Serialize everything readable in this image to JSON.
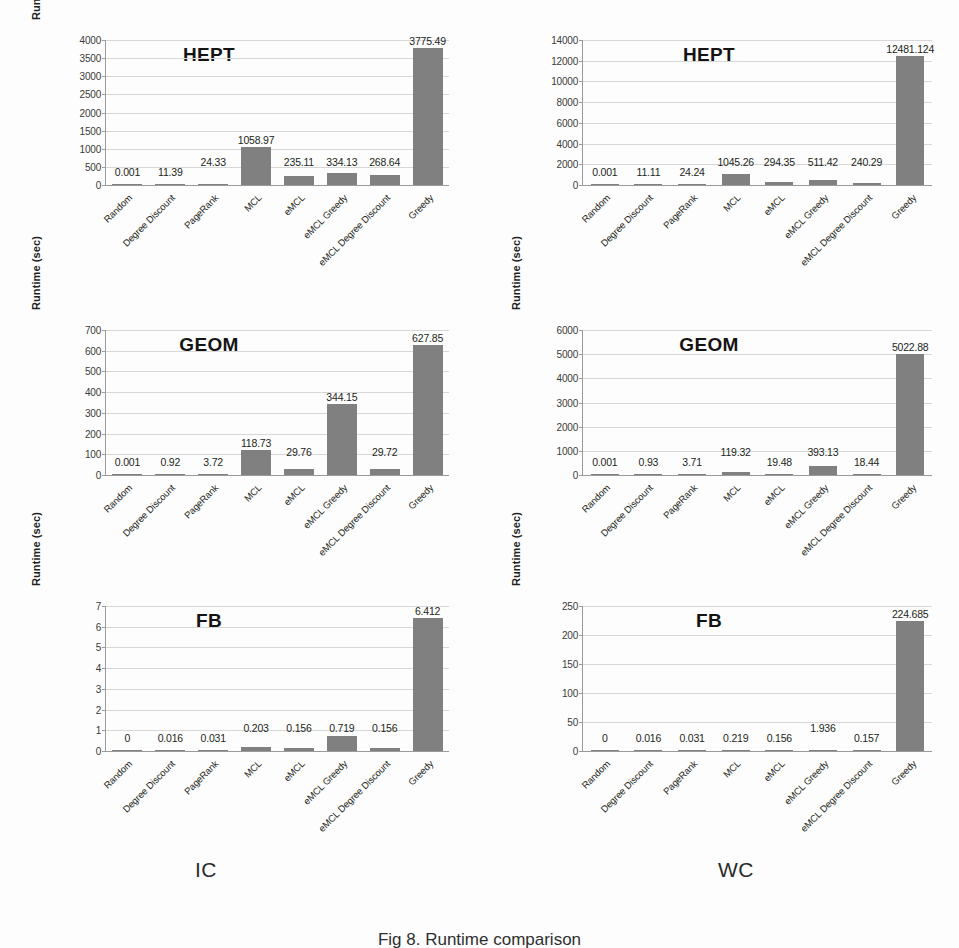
{
  "figure": {
    "column_captions": {
      "left": "IC",
      "right": "WC"
    },
    "caption": "Fig 8. Runtime comparison",
    "bar_color": "#808080",
    "gridline_color": "#d7d7d7",
    "axis_color": "#9a9a9a",
    "text_color": "#231f20"
  },
  "categories": [
    "Random",
    "Degree Discount",
    "PageRank",
    "MCL",
    "eMCL",
    "eMCL Greedy",
    "eMCL Degree Discount",
    "Greedy"
  ],
  "chart_data": [
    {
      "id": "hept-ic",
      "type": "bar",
      "title": "HEPT",
      "xlabel": "",
      "ylabel": "Runtime (sec)",
      "ylim": [
        0,
        4000
      ],
      "yticks": [
        0,
        500,
        1000,
        1500,
        2000,
        2500,
        3000,
        3500,
        4000
      ],
      "ytick_labels": [
        "0",
        "500",
        "1000",
        "1500",
        "2000",
        "2500",
        "3000",
        "3500",
        "4000"
      ],
      "grid": true,
      "legend": "none",
      "categories": [
        "Random",
        "Degree Discount",
        "PageRank",
        "MCL",
        "eMCL",
        "eMCL Greedy",
        "eMCL Degree Discount",
        "Greedy"
      ],
      "values": [
        0.001,
        11.39,
        24.33,
        1058.97,
        235.11,
        334.13,
        268.64,
        3775.49
      ],
      "value_labels": [
        "0.001",
        "11.39",
        "24.33",
        "1058.97",
        "235.11",
        "334.13",
        "268.64",
        "3775.49"
      ]
    },
    {
      "id": "hept-wc",
      "type": "bar",
      "title": "HEPT",
      "xlabel": "",
      "ylabel": "Runtime (sec)",
      "ylim": [
        0,
        14000
      ],
      "yticks": [
        0,
        2000,
        4000,
        6000,
        8000,
        10000,
        12000,
        14000
      ],
      "ytick_labels": [
        "0",
        "2000",
        "4000",
        "6000",
        "8000",
        "10000",
        "12000",
        "14000"
      ],
      "grid": true,
      "legend": "none",
      "categories": [
        "Random",
        "Degree Discount",
        "PageRank",
        "MCL",
        "eMCL",
        "eMCL Greedy",
        "eMCL Degree Discount",
        "Greedy"
      ],
      "values": [
        0.001,
        11.11,
        24.24,
        1045.26,
        294.35,
        511.42,
        240.29,
        12481.124
      ],
      "value_labels": [
        "0.001",
        "11.11",
        "24.24",
        "1045.26",
        "294.35",
        "511.42",
        "240.29",
        "12481.124"
      ]
    },
    {
      "id": "geom-ic",
      "type": "bar",
      "title": "GEOM",
      "xlabel": "",
      "ylabel": "Runtime (sec)",
      "ylim": [
        0,
        700
      ],
      "yticks": [
        0,
        100,
        200,
        300,
        400,
        500,
        600,
        700
      ],
      "ytick_labels": [
        "0",
        "100",
        "200",
        "300",
        "400",
        "500",
        "600",
        "700"
      ],
      "grid": true,
      "legend": "none",
      "categories": [
        "Random",
        "Degree Discount",
        "PageRank",
        "MCL",
        "eMCL",
        "eMCL Greedy",
        "eMCL Degree Discount",
        "Greedy"
      ],
      "values": [
        0.001,
        0.92,
        3.72,
        118.73,
        29.76,
        344.15,
        29.72,
        627.85
      ],
      "value_labels": [
        "0.001",
        "0.92",
        "3.72",
        "118.73",
        "29.76",
        "344.15",
        "29.72",
        "627.85"
      ]
    },
    {
      "id": "geom-wc",
      "type": "bar",
      "title": "GEOM",
      "xlabel": "",
      "ylabel": "Runtime (sec)",
      "ylim": [
        0,
        6000
      ],
      "yticks": [
        0,
        1000,
        2000,
        3000,
        4000,
        5000,
        6000
      ],
      "ytick_labels": [
        "0",
        "1000",
        "2000",
        "3000",
        "4000",
        "5000",
        "6000"
      ],
      "grid": true,
      "legend": "none",
      "categories": [
        "Random",
        "Degree Discount",
        "PageRank",
        "MCL",
        "eMCL",
        "eMCL Greedy",
        "eMCL Degree Discount",
        "Greedy"
      ],
      "values": [
        0.001,
        0.93,
        3.71,
        119.32,
        19.48,
        393.13,
        18.44,
        5022.88
      ],
      "value_labels": [
        "0.001",
        "0.93",
        "3.71",
        "119.32",
        "19.48",
        "393.13",
        "18.44",
        "5022.88"
      ]
    },
    {
      "id": "fb-ic",
      "type": "bar",
      "title": "FB",
      "xlabel": "",
      "ylabel": "Runtime (sec)",
      "ylim": [
        0,
        7
      ],
      "yticks": [
        0,
        1,
        2,
        3,
        4,
        5,
        6,
        7
      ],
      "ytick_labels": [
        "0",
        "1",
        "2",
        "3",
        "4",
        "5",
        "6",
        "7"
      ],
      "grid": true,
      "legend": "none",
      "categories": [
        "Random",
        "Degree Discount",
        "PageRank",
        "MCL",
        "eMCL",
        "eMCL Greedy",
        "eMCL Degree Discount",
        "Greedy"
      ],
      "values": [
        0,
        0.016,
        0.031,
        0.203,
        0.156,
        0.719,
        0.156,
        6.412
      ],
      "value_labels": [
        "0",
        "0.016",
        "0.031",
        "0.203",
        "0.156",
        "0.719",
        "0.156",
        "6.412"
      ]
    },
    {
      "id": "fb-wc",
      "type": "bar",
      "title": "FB",
      "xlabel": "",
      "ylabel": "Runtime (sec)",
      "ylim": [
        0,
        250
      ],
      "yticks": [
        0,
        50,
        100,
        150,
        200,
        250
      ],
      "ytick_labels": [
        "0",
        "50",
        "100",
        "150",
        "200",
        "250"
      ],
      "grid": true,
      "legend": "none",
      "categories": [
        "Random",
        "Degree Discount",
        "PageRank",
        "MCL",
        "eMCL",
        "eMCL Greedy",
        "eMCL Degree Discount",
        "Greedy"
      ],
      "values": [
        0,
        0.016,
        0.031,
        0.219,
        0.156,
        1.936,
        0.157,
        224.685
      ],
      "value_labels": [
        "0",
        "0.016",
        "0.031",
        "0.219",
        "0.156",
        "1.936",
        "0.157",
        "224.685"
      ]
    }
  ]
}
